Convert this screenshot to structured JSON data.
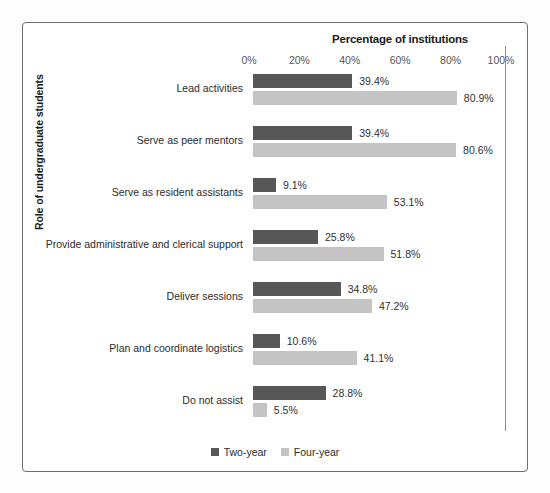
{
  "chart_data": {
    "type": "bar",
    "orientation": "horizontal",
    "title": "",
    "xlabel": "Percentage of institutions",
    "ylabel": "Role of undergraduate students",
    "xlim": [
      0,
      100
    ],
    "xticks": [
      "0%",
      "20%",
      "40%",
      "60%",
      "80%",
      "100%"
    ],
    "xtick_values": [
      0,
      20,
      40,
      60,
      80,
      100
    ],
    "grid": false,
    "legend_position": "bottom-center",
    "categories": [
      "Lead activities",
      "Serve as peer mentors",
      "Serve as resident assistants",
      "Provide administrative and clerical support",
      "Deliver sessions",
      "Plan and coordinate logistics",
      "Do not assist"
    ],
    "series": [
      {
        "name": "Two-year",
        "color": "#575757",
        "values": [
          39.4,
          39.4,
          9.1,
          25.8,
          34.8,
          10.6,
          28.8
        ],
        "labels": [
          "39.4%",
          "39.4%",
          "9.1%",
          "25.8%",
          "34.8%",
          "10.6%",
          "28.8%"
        ]
      },
      {
        "name": "Four-year",
        "color": "#c4c4c4",
        "values": [
          80.9,
          80.6,
          53.1,
          51.8,
          47.2,
          41.1,
          5.5
        ],
        "labels": [
          "80.9%",
          "80.6%",
          "53.1%",
          "51.8%",
          "47.2%",
          "41.1%",
          "5.5%"
        ]
      }
    ]
  },
  "legend": [
    {
      "label": "Two-year",
      "color": "#575757"
    },
    {
      "label": "Four-year",
      "color": "#c4c4c4"
    }
  ]
}
